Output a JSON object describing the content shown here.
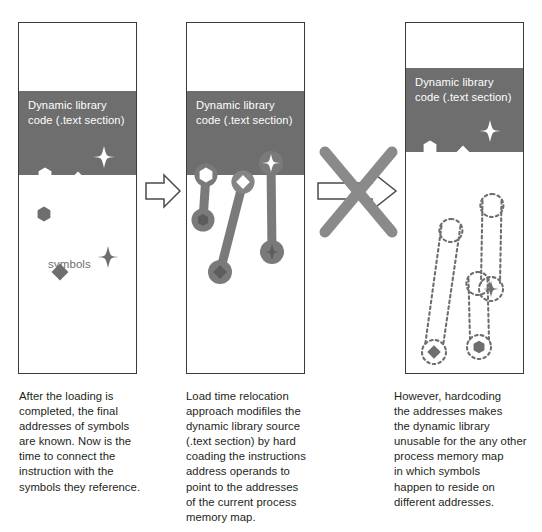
{
  "figure": {
    "background_color": "#ffffff",
    "band_color": "#6e6e6e",
    "symbol_gray": "#6e6e6e",
    "symbol_white": "#ffffff",
    "border_color": "#3b3b3b",
    "connector_color": "#7a7a7a",
    "text_color": "#231f20"
  },
  "panels": [
    {
      "id": "panel-1",
      "band_label": "Dynamic library\ncode (.text section)",
      "symbols_label": "symbols",
      "caption": "After the loading is\ncompleted, the final\naddresses of symbols\nare known. Now is the\ntime to connect the\ninstruction with the\nsymbols they reference.",
      "code_symbols": [
        {
          "shape": "hexagon",
          "fill": "white"
        },
        {
          "shape": "diamond",
          "fill": "white"
        },
        {
          "shape": "star4",
          "fill": "white"
        }
      ],
      "memory_symbols": [
        {
          "shape": "hexagon",
          "fill": "gray"
        },
        {
          "shape": "star4",
          "fill": "gray"
        },
        {
          "shape": "diamond",
          "fill": "gray"
        }
      ]
    },
    {
      "id": "panel-2",
      "band_label": "Dynamic library\ncode (.text section)",
      "caption": "Load time relocation\napproach modifiles the\ndynamic library source\n(.text section) by hard\ncoading the instructions\naddress operands to\npoint to the addresses\nof the current process\nmemory map.",
      "connectors": [
        {
          "from_shape": "hexagon",
          "to_shape": "hexagon",
          "style": "solid"
        },
        {
          "from_shape": "diamond",
          "to_shape": "diamond",
          "style": "solid"
        },
        {
          "from_shape": "star4",
          "to_shape": "star4",
          "style": "solid"
        }
      ]
    },
    {
      "id": "panel-3",
      "band_label": "Dynamic library\ncode (.text section)",
      "caption": "However, hardcoding\nthe addresses makes\nthe dynamic library\nunusable for the any other\nprocess memory map\nin which symbols\nhappen to reside on\ndifferent addresses.",
      "code_symbols": [
        {
          "shape": "hexagon",
          "fill": "white"
        },
        {
          "shape": "diamond",
          "fill": "white"
        },
        {
          "shape": "star4",
          "fill": "white"
        }
      ],
      "connectors": [
        {
          "from_shape": "circle-empty",
          "to_shape": "diamond",
          "style": "dashed"
        },
        {
          "from_shape": "circle-empty",
          "to_shape": "star4",
          "style": "dashed"
        },
        {
          "from_shape": "circle-empty",
          "to_shape": "hexagon",
          "style": "dashed"
        }
      ]
    }
  ],
  "arrows": [
    {
      "id": "arrow-1-2",
      "label": "",
      "crossed_out": false
    },
    {
      "id": "arrow-2-3",
      "label": "",
      "crossed_out": true
    }
  ]
}
